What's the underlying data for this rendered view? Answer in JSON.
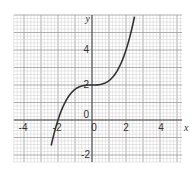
{
  "chart_data": {
    "type": "line",
    "title": "",
    "xlabel": "x",
    "ylabel": "y",
    "xlim": [
      -4.6,
      5.3
    ],
    "ylim": [
      -2.4,
      6.0
    ],
    "grid": true,
    "x_ticks": [
      -4,
      -2,
      0,
      2,
      4
    ],
    "y_ticks": [
      -2,
      0,
      2,
      4
    ],
    "x_tick_labels": [
      "-4",
      "-2",
      "0",
      "2",
      "4"
    ],
    "y_tick_labels": [
      "-2",
      "0",
      "2",
      "4"
    ],
    "origin_label": "0",
    "series": [
      {
        "name": "y = x^3/4 + 2",
        "x": [
          -2.4,
          -2.2,
          -2.0,
          -1.8,
          -1.6,
          -1.4,
          -1.2,
          -1.0,
          -0.8,
          -0.6,
          -0.4,
          -0.2,
          0.0,
          0.2,
          0.4,
          0.6,
          0.8,
          1.0,
          1.2,
          1.4,
          1.6,
          1.8,
          2.0,
          2.2,
          2.4,
          2.6
        ],
        "values": [
          -1.46,
          -0.66,
          0.0,
          0.54,
          0.98,
          1.31,
          1.57,
          1.75,
          1.87,
          1.95,
          1.98,
          2.0,
          2.0,
          2.0,
          2.02,
          2.05,
          2.13,
          2.25,
          2.43,
          2.69,
          3.02,
          3.46,
          4.0,
          4.66,
          5.46,
          6.39
        ]
      }
    ]
  },
  "labels": {
    "x_axis": "x",
    "y_axis": "y",
    "x_tick_neg4": "-4",
    "x_tick_neg2": "-2",
    "x_tick_0": "0",
    "x_tick_2": "2",
    "x_tick_4": "4",
    "y_tick_neg2": "-2",
    "y_tick_0": "0",
    "y_tick_2": "2",
    "y_tick_4": "4"
  }
}
